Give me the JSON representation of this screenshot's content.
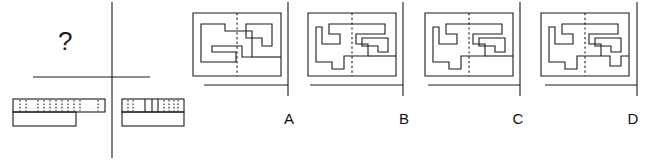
{
  "figure": {
    "type": "visual-reasoning-puzzle",
    "prompt_symbol": "?",
    "stroke_color": "#1a1a1a",
    "background_color": "#ffffff",
    "option_labels": [
      "A",
      "B",
      "C",
      "D"
    ],
    "left_panel": {
      "description": "question area with question mark above baseline and two hatched bar shapes below",
      "shapes": [
        {
          "name": "hatched-bar-left",
          "hatch_marks": 9,
          "has_lower_extension": true
        },
        {
          "name": "hatched-bar-right",
          "hatch_marks": 6,
          "has_lower_extension": true
        }
      ]
    },
    "options": [
      {
        "label": "A",
        "name": "maze-option-a",
        "baseline_segment": "short-centered",
        "bottom_feature": "none"
      },
      {
        "label": "B",
        "name": "maze-option-b",
        "baseline_segment": "left-offset",
        "bottom_feature": "down-tab-left"
      },
      {
        "label": "C",
        "name": "maze-option-c",
        "baseline_segment": "left-offset",
        "bottom_feature": "down-tab-left"
      },
      {
        "label": "D",
        "name": "maze-option-d",
        "baseline_segment": "left-offset",
        "bottom_feature": "down-tab-left-and-up-notch-right"
      }
    ]
  }
}
